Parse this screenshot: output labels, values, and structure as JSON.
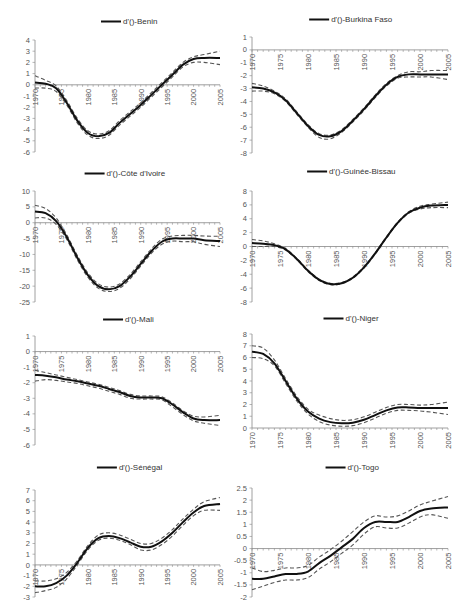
{
  "chart_data": [
    {
      "type": "line",
      "title": "d'()-Benin",
      "legend": [
        "d'()-Benin"
      ],
      "xlabel": "",
      "ylabel": "",
      "xlim": [
        1970,
        2005
      ],
      "ylim": [
        -6,
        4
      ],
      "yticks": [
        4,
        3,
        2,
        1,
        0,
        -1,
        -2,
        -3,
        -4,
        -5,
        -6
      ],
      "xticks": [
        1970,
        1975,
        1980,
        1985,
        1990,
        1995,
        2000,
        2005
      ],
      "x": [
        1970,
        1972,
        1974,
        1976,
        1978,
        1980,
        1982,
        1984,
        1986,
        1988,
        1990,
        1992,
        1994,
        1996,
        1998,
        2000,
        2002,
        2005
      ],
      "series": [
        {
          "name": "d'()-Benin",
          "values": [
            0.2,
            0.1,
            -0.3,
            -1.6,
            -3.2,
            -4.3,
            -4.6,
            -4.3,
            -3.4,
            -2.6,
            -1.8,
            -0.9,
            0.0,
            0.9,
            1.8,
            2.3,
            2.4,
            2.4
          ]
        },
        {
          "name": "upper bound",
          "values": [
            0.8,
            0.4,
            -0.1,
            -1.4,
            -3.0,
            -4.1,
            -4.4,
            -4.1,
            -3.2,
            -2.4,
            -1.6,
            -0.7,
            0.2,
            1.1,
            2.0,
            2.5,
            2.7,
            3.0
          ]
        },
        {
          "name": "lower bound",
          "values": [
            -0.3,
            -0.3,
            -0.6,
            -1.8,
            -3.4,
            -4.5,
            -4.8,
            -4.5,
            -3.6,
            -2.8,
            -2.0,
            -1.1,
            -0.2,
            0.7,
            1.6,
            2.0,
            2.0,
            1.8
          ]
        }
      ],
      "grid": false
    },
    {
      "type": "line",
      "title": "d'()-Burkina Faso",
      "legend": [
        "d'()-Burkina Faso"
      ],
      "xlabel": "",
      "ylabel": "",
      "xlim": [
        1970,
        2005
      ],
      "ylim": [
        -8,
        1
      ],
      "yticks": [
        1,
        0,
        -1,
        -2,
        -3,
        -4,
        -5,
        -6,
        -7,
        -8
      ],
      "xticks": [
        1970,
        1975,
        1980,
        1985,
        1990,
        1995,
        2000,
        2005
      ],
      "x": [
        1970,
        1972,
        1974,
        1976,
        1978,
        1980,
        1982,
        1984,
        1986,
        1988,
        1990,
        1992,
        1994,
        1996,
        1998,
        2000,
        2002,
        2005
      ],
      "series": [
        {
          "name": "d'()-Burkina Faso",
          "values": [
            -2.9,
            -3.0,
            -3.3,
            -3.9,
            -4.9,
            -5.9,
            -6.6,
            -6.7,
            -6.3,
            -5.5,
            -4.6,
            -3.6,
            -2.7,
            -2.1,
            -1.9,
            -1.9,
            -1.9,
            -1.9
          ]
        },
        {
          "name": "upper bound",
          "values": [
            -2.6,
            -2.8,
            -3.2,
            -3.8,
            -4.8,
            -5.8,
            -6.5,
            -6.6,
            -6.2,
            -5.4,
            -4.5,
            -3.5,
            -2.6,
            -2.0,
            -1.7,
            -1.7,
            -1.6,
            -1.6
          ]
        },
        {
          "name": "lower bound",
          "values": [
            -3.2,
            -3.2,
            -3.4,
            -4.0,
            -5.0,
            -6.0,
            -6.8,
            -6.9,
            -6.4,
            -5.6,
            -4.7,
            -3.7,
            -2.8,
            -2.2,
            -2.1,
            -2.1,
            -2.1,
            -2.3
          ]
        }
      ],
      "grid": false
    },
    {
      "type": "line",
      "title": "d'()-Côte d'Ivoire",
      "legend": [
        "d'()-Côte d'Ivoire"
      ],
      "xlabel": "",
      "ylabel": "",
      "xlim": [
        1970,
        2005
      ],
      "ylim": [
        -25,
        10
      ],
      "yticks": [
        10,
        5,
        0,
        -5,
        -10,
        -15,
        -20,
        -25
      ],
      "xticks": [
        1970,
        1975,
        1980,
        1985,
        1990,
        1995,
        2000,
        2005
      ],
      "x": [
        1970,
        1972,
        1974,
        1976,
        1978,
        1980,
        1982,
        1984,
        1986,
        1988,
        1990,
        1992,
        1994,
        1996,
        1998,
        2000,
        2002,
        2005
      ],
      "series": [
        {
          "name": "d'()-Côte d'Ivoire",
          "values": [
            3.5,
            3.0,
            0.5,
            -4.5,
            -11.0,
            -16.5,
            -20.0,
            -21.0,
            -20.0,
            -17.0,
            -13.0,
            -9.0,
            -6.0,
            -5.0,
            -5.0,
            -5.0,
            -5.5,
            -5.8
          ]
        },
        {
          "name": "upper bound",
          "values": [
            5.5,
            4.5,
            1.5,
            -3.8,
            -10.3,
            -15.8,
            -19.3,
            -20.3,
            -19.3,
            -16.3,
            -12.3,
            -8.3,
            -5.2,
            -4.2,
            -4.0,
            -4.0,
            -4.2,
            -4.3
          ]
        },
        {
          "name": "lower bound",
          "values": [
            1.5,
            1.5,
            -0.5,
            -5.2,
            -11.7,
            -17.2,
            -20.7,
            -21.7,
            -20.7,
            -17.7,
            -13.7,
            -9.7,
            -6.8,
            -5.8,
            -6.0,
            -6.0,
            -6.8,
            -7.5
          ]
        }
      ],
      "grid": false
    },
    {
      "type": "line",
      "title": "d'()-Guinée-Bissau",
      "legend": [
        "d'()-Guinée-Bissau"
      ],
      "xlabel": "",
      "ylabel": "",
      "xlim": [
        1970,
        2005
      ],
      "ylim": [
        -8,
        8
      ],
      "yticks": [
        8,
        6,
        4,
        2,
        0,
        -2,
        -4,
        -6,
        -8
      ],
      "xticks": [
        1970,
        1975,
        1980,
        1985,
        1990,
        1995,
        2000,
        2005
      ],
      "x": [
        1970,
        1972,
        1974,
        1976,
        1978,
        1980,
        1982,
        1984,
        1986,
        1988,
        1990,
        1992,
        1994,
        1996,
        1998,
        2000,
        2002,
        2005
      ],
      "series": [
        {
          "name": "d'()-Guinée-Bissau",
          "values": [
            0.5,
            0.4,
            0.2,
            -0.4,
            -1.8,
            -3.5,
            -4.8,
            -5.4,
            -5.3,
            -4.5,
            -3.0,
            -1.0,
            1.3,
            3.4,
            4.9,
            5.6,
            5.9,
            6.0
          ]
        },
        {
          "name": "upper bound",
          "values": [
            1.0,
            0.8,
            0.4,
            -0.3,
            -1.7,
            -3.4,
            -4.7,
            -5.3,
            -5.2,
            -4.4,
            -2.9,
            -0.9,
            1.4,
            3.5,
            5.0,
            5.8,
            6.1,
            6.4
          ]
        },
        {
          "name": "lower bound",
          "values": [
            0.0,
            0.0,
            0.0,
            -0.5,
            -1.9,
            -3.6,
            -4.9,
            -5.5,
            -5.4,
            -4.6,
            -3.1,
            -1.1,
            1.2,
            3.3,
            4.8,
            5.4,
            5.6,
            5.6
          ]
        }
      ],
      "grid": false
    },
    {
      "type": "line",
      "title": "d'()-Mali",
      "legend": [
        "d'()-Mali"
      ],
      "xlabel": "",
      "ylabel": "",
      "xlim": [
        1970,
        2005
      ],
      "ylim": [
        -6,
        1
      ],
      "yticks": [
        1,
        0,
        -1,
        -2,
        -3,
        -4,
        -5,
        -6
      ],
      "xticks": [
        1970,
        1975,
        1980,
        1985,
        1990,
        1995,
        2000,
        2005
      ],
      "x": [
        1970,
        1972,
        1974,
        1976,
        1978,
        1980,
        1982,
        1984,
        1986,
        1988,
        1990,
        1992,
        1994,
        1996,
        1998,
        2000,
        2002,
        2005
      ],
      "series": [
        {
          "name": "d'()-Mali",
          "values": [
            -1.5,
            -1.55,
            -1.65,
            -1.8,
            -1.9,
            -2.05,
            -2.2,
            -2.4,
            -2.6,
            -2.85,
            -2.95,
            -2.95,
            -3.0,
            -3.4,
            -3.9,
            -4.3,
            -4.4,
            -4.4
          ]
        },
        {
          "name": "upper bound",
          "values": [
            -1.2,
            -1.35,
            -1.5,
            -1.65,
            -1.8,
            -1.95,
            -2.1,
            -2.3,
            -2.5,
            -2.75,
            -2.85,
            -2.85,
            -2.9,
            -3.3,
            -3.8,
            -4.15,
            -4.2,
            -4.1
          ]
        },
        {
          "name": "lower bound",
          "values": [
            -1.9,
            -1.8,
            -1.85,
            -1.95,
            -2.05,
            -2.2,
            -2.35,
            -2.55,
            -2.75,
            -3.0,
            -3.05,
            -3.05,
            -3.1,
            -3.55,
            -4.05,
            -4.45,
            -4.6,
            -4.75
          ]
        }
      ],
      "grid": false
    },
    {
      "type": "line",
      "title": "d'()-Niger",
      "legend": [
        "d'()-Niger"
      ],
      "xlabel": "",
      "ylabel": "",
      "xlim": [
        1970,
        2005
      ],
      "ylim": [
        0,
        8
      ],
      "yticks": [
        8,
        7,
        6,
        5,
        4,
        3,
        2,
        1,
        0
      ],
      "xticks": [
        1970,
        1975,
        1980,
        1985,
        1990,
        1995,
        2000,
        2005
      ],
      "x": [
        1970,
        1972,
        1974,
        1976,
        1978,
        1980,
        1982,
        1984,
        1986,
        1988,
        1990,
        1992,
        1994,
        1996,
        1998,
        2000,
        2002,
        2005
      ],
      "series": [
        {
          "name": "d'()-Niger",
          "values": [
            6.5,
            6.3,
            5.5,
            4.0,
            2.5,
            1.4,
            0.8,
            0.5,
            0.4,
            0.45,
            0.7,
            1.1,
            1.5,
            1.75,
            1.75,
            1.7,
            1.7,
            1.7
          ]
        },
        {
          "name": "upper bound",
          "values": [
            7.0,
            6.8,
            5.8,
            4.2,
            2.7,
            1.6,
            1.1,
            0.8,
            0.65,
            0.7,
            0.95,
            1.35,
            1.75,
            2.0,
            2.0,
            1.95,
            2.0,
            2.2
          ]
        },
        {
          "name": "lower bound",
          "values": [
            6.0,
            5.9,
            5.3,
            3.8,
            2.3,
            1.2,
            0.55,
            0.25,
            0.15,
            0.2,
            0.45,
            0.85,
            1.25,
            1.5,
            1.5,
            1.45,
            1.35,
            1.15
          ]
        }
      ],
      "grid": false
    },
    {
      "type": "line",
      "title": "d'()-Sénégal",
      "legend": [
        "d'()-Sénégal"
      ],
      "xlabel": "",
      "ylabel": "",
      "xlim": [
        1970,
        2005
      ],
      "ylim": [
        -3,
        7
      ],
      "yticks": [
        7,
        6,
        5,
        4,
        3,
        2,
        1,
        0,
        -1,
        -2,
        -3
      ],
      "xticks": [
        1970,
        1975,
        1980,
        1985,
        1990,
        1995,
        2000,
        2005
      ],
      "x": [
        1970,
        1972,
        1974,
        1976,
        1978,
        1980,
        1982,
        1984,
        1986,
        1988,
        1990,
        1992,
        1994,
        1996,
        1998,
        2000,
        2002,
        2005
      ],
      "series": [
        {
          "name": "d'()-Sénégal",
          "values": [
            -2.0,
            -2.0,
            -1.7,
            -1.0,
            0.2,
            1.6,
            2.5,
            2.7,
            2.5,
            2.1,
            1.7,
            1.7,
            2.2,
            3.0,
            4.0,
            4.9,
            5.5,
            5.7
          ]
        },
        {
          "name": "upper bound",
          "values": [
            -1.5,
            -1.5,
            -1.3,
            -0.7,
            0.4,
            1.8,
            2.8,
            3.0,
            2.8,
            2.4,
            2.0,
            2.0,
            2.5,
            3.3,
            4.3,
            5.2,
            5.9,
            6.3
          ]
        },
        {
          "name": "lower bound",
          "values": [
            -2.6,
            -2.4,
            -2.1,
            -1.3,
            0.0,
            1.4,
            2.3,
            2.5,
            2.3,
            1.9,
            1.4,
            1.4,
            1.9,
            2.7,
            3.7,
            4.6,
            5.1,
            5.1
          ]
        }
      ],
      "grid": false
    },
    {
      "type": "line",
      "title": "d'()-Togo",
      "legend": [
        "d'()-Togo"
      ],
      "xlabel": "",
      "ylabel": "",
      "xlim": [
        1970,
        2005
      ],
      "ylim": [
        -2,
        2.5
      ],
      "yticks": [
        2.5,
        2,
        1.5,
        1,
        0.5,
        0,
        -0.5,
        -1,
        -1.5,
        -2
      ],
      "xticks": [
        1970,
        1975,
        1980,
        1985,
        1990,
        1995,
        2000,
        2005
      ],
      "x": [
        1970,
        1972,
        1974,
        1976,
        1978,
        1980,
        1982,
        1984,
        1986,
        1988,
        1990,
        1992,
        1994,
        1996,
        1998,
        2000,
        2002,
        2005
      ],
      "series": [
        {
          "name": "d'()-Togo",
          "values": [
            -1.25,
            -1.25,
            -1.15,
            -1.05,
            -1.05,
            -0.95,
            -0.6,
            -0.3,
            0.05,
            0.4,
            0.85,
            1.1,
            1.1,
            1.1,
            1.3,
            1.55,
            1.65,
            1.7
          ]
        },
        {
          "name": "upper bound",
          "values": [
            -0.8,
            -0.95,
            -0.9,
            -0.8,
            -0.8,
            -0.7,
            -0.35,
            -0.05,
            0.3,
            0.7,
            1.1,
            1.35,
            1.3,
            1.35,
            1.55,
            1.8,
            1.95,
            2.15
          ]
        },
        {
          "name": "lower bound",
          "values": [
            -1.7,
            -1.55,
            -1.4,
            -1.3,
            -1.3,
            -1.2,
            -0.85,
            -0.55,
            -0.2,
            0.15,
            0.6,
            0.9,
            0.85,
            0.85,
            1.05,
            1.3,
            1.4,
            1.25
          ]
        }
      ],
      "grid": false
    }
  ],
  "layout": {
    "panels": [
      {
        "x0": 35,
        "x1": 220,
        "y_top": 40,
        "y_bottom": 152,
        "title_y": 24
      },
      {
        "x0": 252,
        "x1": 448,
        "y_top": 37,
        "y_bottom": 153,
        "title_y": 22
      },
      {
        "x0": 35,
        "x1": 220,
        "y_top": 191,
        "y_bottom": 302,
        "title_y": 176
      },
      {
        "x0": 252,
        "x1": 448,
        "y_top": 191,
        "y_bottom": 302,
        "title_y": 174
      },
      {
        "x0": 35,
        "x1": 220,
        "y_top": 336,
        "y_bottom": 445,
        "title_y": 322
      },
      {
        "x0": 252,
        "x1": 448,
        "y_top": 334,
        "y_bottom": 428,
        "title_y": 321
      },
      {
        "x0": 35,
        "x1": 220,
        "y_top": 490,
        "y_bottom": 597,
        "title_y": 470
      },
      {
        "x0": 252,
        "x1": 448,
        "y_top": 488,
        "y_bottom": 597,
        "title_y": 470
      }
    ]
  }
}
